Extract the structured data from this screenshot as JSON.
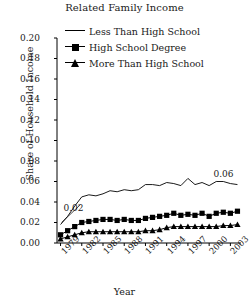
{
  "chart_data": {
    "type": "line",
    "title": "Related Family Income",
    "xlabel": "Year",
    "ylabel": "Share of Household Income",
    "ylim": [
      0.0,
      0.2
    ],
    "xlim": [
      1978.5,
      2004.5
    ],
    "grid": false,
    "legend_position": "top-right-inside",
    "ytick_labels": [
      "0.20",
      "0.18",
      "0.16",
      "0.14",
      "0.12",
      "0.10",
      "0.08",
      "0.06",
      "0.04",
      "0.02",
      "0.00"
    ],
    "ytick_values": [
      0.2,
      0.18,
      0.16,
      0.14,
      0.12,
      0.1,
      0.08,
      0.06,
      0.04,
      0.02,
      0.0
    ],
    "xtick_labels": [
      "1979",
      "1982",
      "1985",
      "1988",
      "1991",
      "1994",
      "1997",
      "2000",
      "2003"
    ],
    "xtick_values": [
      1979,
      1982,
      1985,
      1988,
      1991,
      1994,
      1997,
      2000,
      2003
    ],
    "x": [
      1979,
      1980,
      1981,
      1982,
      1983,
      1984,
      1985,
      1986,
      1987,
      1988,
      1989,
      1990,
      1991,
      1992,
      1993,
      1994,
      1995,
      1996,
      1997,
      1998,
      1999,
      2000,
      2001,
      2002,
      2003,
      2004
    ],
    "series": [
      {
        "name": "Less Than High School",
        "marker": "none",
        "values": [
          0.018,
          0.026,
          0.036,
          0.045,
          0.047,
          0.046,
          0.048,
          0.051,
          0.05,
          0.052,
          0.051,
          0.052,
          0.057,
          0.057,
          0.056,
          0.059,
          0.058,
          0.056,
          0.063,
          0.057,
          0.059,
          0.056,
          0.06,
          0.06,
          0.058,
          0.057
        ]
      },
      {
        "name": "High School Degree",
        "marker": "square",
        "values": [
          0.008,
          0.012,
          0.016,
          0.02,
          0.021,
          0.022,
          0.023,
          0.023,
          0.022,
          0.023,
          0.022,
          0.022,
          0.024,
          0.025,
          0.026,
          0.027,
          0.029,
          0.027,
          0.028,
          0.027,
          0.029,
          0.026,
          0.029,
          0.03,
          0.029,
          0.031
        ]
      },
      {
        "name": "More Than High School",
        "marker": "triangle",
        "values": [
          0.004,
          0.006,
          0.008,
          0.01,
          0.011,
          0.011,
          0.011,
          0.011,
          0.011,
          0.011,
          0.011,
          0.011,
          0.012,
          0.012,
          0.013,
          0.015,
          0.016,
          0.016,
          0.016,
          0.016,
          0.016,
          0.016,
          0.016,
          0.017,
          0.017,
          0.018
        ]
      }
    ],
    "annotations": [
      {
        "text": "0.02",
        "x": 1979,
        "y": 0.018,
        "position": "upper-right-of-point"
      },
      {
        "text": "0.06",
        "x": 2004,
        "y": 0.057,
        "position": "upper-right-of-point"
      }
    ],
    "colors": {
      "line": "#000000",
      "axis": "#000000",
      "background": "#ffffff"
    }
  }
}
